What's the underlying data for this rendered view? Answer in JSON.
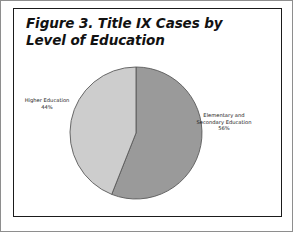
{
  "figure": {
    "title": "Figure 3. Title IX Cases by Level of Education",
    "frame_color": "#1b1b1b",
    "background": "#ffffff"
  },
  "chart_data": {
    "type": "pie",
    "title": "Figure 3. Title IX Cases by Level of Education",
    "xlabel": "",
    "ylabel": "",
    "legend_position": "none",
    "grid": false,
    "categories": [
      "Elementary and Secondary Education",
      "Higher Education"
    ],
    "values": [
      56,
      44
    ],
    "unit": "%",
    "start_angle_deg": 0,
    "direction": "clockwise",
    "slices": [
      {
        "label": "Elementary and Secondary Education",
        "label_text": "Elementary and\nSecondary Education\n56%",
        "value": 56,
        "percent_text": "56%",
        "color": "#9a9a9a",
        "edge_color": "#5a5a5a"
      },
      {
        "label": "Higher Education",
        "label_text": "Higher Education\n44%",
        "value": 44,
        "percent_text": "44%",
        "color": "#cdcdcd",
        "edge_color": "#5a5a5a"
      }
    ]
  }
}
